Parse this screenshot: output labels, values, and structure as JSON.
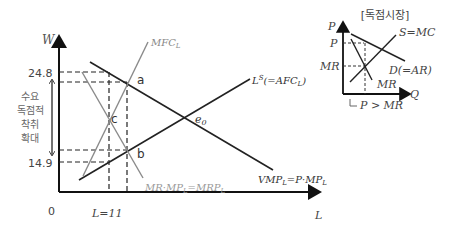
{
  "main": {
    "y_axis_label": "W",
    "x_axis_label": "L",
    "origin_label": "0",
    "wage_high": "24.8",
    "wage_low": "14.9",
    "labor_label": "L=11",
    "exploitation_label": [
      "수요",
      "독점적",
      "착취",
      "확대"
    ],
    "points": {
      "a": "a",
      "b": "b",
      "c": "c",
      "e0": "e0"
    },
    "curves": {
      "mfc": "MFC_L",
      "supply": "L^S(=AFC_L)",
      "mrp": "MR·MP_L=MRP_L",
      "vmp": "VMP_L=P·MP_L"
    }
  },
  "inset": {
    "title": "[독점시장]",
    "y_axis_label": "P",
    "x_axis_label": "Q",
    "price_tick": "P",
    "mr_tick": "MR",
    "supply_label": "S=MC",
    "demand_label": "D(=AR)",
    "mr_curve_label": "MR",
    "note": "P > MR"
  },
  "colors": {
    "black": "#222222",
    "gray": "#8a8a8a"
  }
}
